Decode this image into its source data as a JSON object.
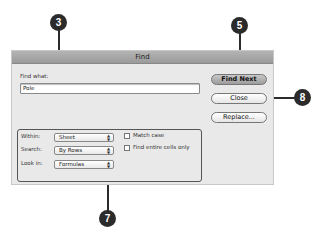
{
  "dialog": {
    "title": "Find",
    "find_what_label": "Find what:",
    "find_what_value": "Pole",
    "buttons": {
      "find_next": "Find Next",
      "close": "Close",
      "replace": "Replace..."
    },
    "options": {
      "within_label": "Within:",
      "within_value": "Sheet",
      "search_label": "Search:",
      "search_value": "By Rows",
      "look_in_label": "Look in:",
      "look_in_value": "Formulas",
      "match_case_label": "Match case",
      "match_case_checked": false,
      "entire_cells_label": "Find entire cells only",
      "entire_cells_checked": false
    }
  },
  "callouts": {
    "c3": "3",
    "c5": "5",
    "c7": "7",
    "c8": "8"
  }
}
